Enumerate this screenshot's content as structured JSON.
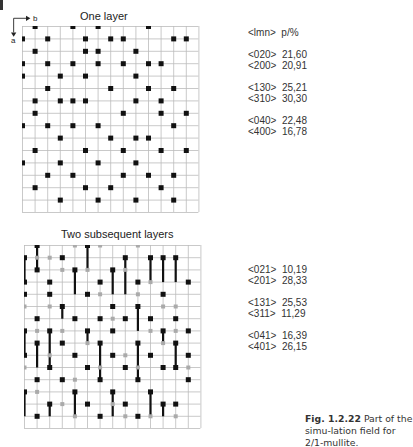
{
  "figure": {
    "axis_b_label": "b",
    "axis_a_label": "a",
    "panel1": {
      "title": "One layer",
      "cols": 14,
      "rows": 15,
      "dots": [
        [
          1,
          0
        ],
        [
          4,
          0
        ],
        [
          6,
          0
        ],
        [
          8,
          1
        ],
        [
          0,
          1
        ],
        [
          2,
          1
        ],
        [
          5,
          1
        ],
        [
          10,
          0
        ],
        [
          12,
          1
        ],
        [
          13,
          1
        ],
        [
          1,
          2
        ],
        [
          7,
          1
        ],
        [
          9,
          2
        ],
        [
          5,
          2
        ],
        [
          6,
          2
        ],
        [
          0,
          3
        ],
        [
          2,
          3
        ],
        [
          4,
          3
        ],
        [
          6,
          3
        ],
        [
          8,
          3
        ],
        [
          10,
          3
        ],
        [
          11,
          3
        ],
        [
          3,
          4
        ],
        [
          0,
          4
        ],
        [
          5,
          4
        ],
        [
          9,
          4
        ],
        [
          12,
          5
        ],
        [
          2,
          5
        ],
        [
          7,
          5
        ],
        [
          10,
          5
        ],
        [
          3,
          6
        ],
        [
          5,
          6
        ],
        [
          11,
          6
        ],
        [
          1,
          6
        ],
        [
          4,
          6
        ],
        [
          9,
          6
        ],
        [
          1,
          7
        ],
        [
          8,
          7
        ],
        [
          11,
          7
        ],
        [
          13,
          7
        ],
        [
          0,
          8
        ],
        [
          6,
          8
        ],
        [
          2,
          8
        ],
        [
          4,
          8
        ],
        [
          12,
          8
        ],
        [
          3,
          9
        ],
        [
          7,
          9
        ],
        [
          9,
          9
        ],
        [
          10,
          9
        ],
        [
          1,
          10
        ],
        [
          5,
          10
        ],
        [
          8,
          10
        ],
        [
          11,
          10
        ],
        [
          13,
          10
        ],
        [
          0,
          11
        ],
        [
          3,
          11
        ],
        [
          6,
          11
        ],
        [
          9,
          11
        ],
        [
          2,
          12
        ],
        [
          4,
          12
        ],
        [
          8,
          12
        ],
        [
          10,
          12
        ],
        [
          12,
          12
        ],
        [
          1,
          13
        ],
        [
          5,
          13
        ],
        [
          7,
          13
        ],
        [
          11,
          13
        ],
        [
          3,
          14
        ],
        [
          6,
          14
        ],
        [
          9,
          14
        ],
        [
          12,
          14
        ]
      ],
      "table": [
        {
          "hkl": "<lmn>",
          "p": "p/%"
        },
        null,
        {
          "hkl": "<020>",
          "p": "21,60"
        },
        {
          "hkl": "<200>",
          "p": "20,91"
        },
        null,
        {
          "hkl": "<130>",
          "p": "25,21"
        },
        {
          "hkl": "<310>",
          "p": "30,30"
        },
        null,
        {
          "hkl": "<040>",
          "p": "22,48"
        },
        {
          "hkl": "<400>",
          "p": "16,78"
        }
      ]
    },
    "panel2": {
      "title": "Two subsequent layers",
      "cols": 14,
      "rows": 15,
      "black": [
        [
          0,
          1
        ],
        [
          1,
          0
        ],
        [
          3,
          1
        ],
        [
          5,
          0
        ],
        [
          8,
          1
        ],
        [
          10,
          1
        ],
        [
          11,
          1
        ],
        [
          12,
          1
        ],
        [
          0,
          3
        ],
        [
          1,
          2
        ],
        [
          2,
          3
        ],
        [
          4,
          2
        ],
        [
          6,
          3
        ],
        [
          7,
          2
        ],
        [
          9,
          3
        ],
        [
          13,
          3
        ],
        [
          0,
          4
        ],
        [
          2,
          4
        ],
        [
          3,
          5
        ],
        [
          5,
          4
        ],
        [
          7,
          5
        ],
        [
          9,
          5
        ],
        [
          11,
          4
        ],
        [
          1,
          6
        ],
        [
          4,
          6
        ],
        [
          6,
          6
        ],
        [
          8,
          6
        ],
        [
          10,
          6
        ],
        [
          12,
          6
        ],
        [
          0,
          7
        ],
        [
          2,
          7
        ],
        [
          5,
          7
        ],
        [
          7,
          7
        ],
        [
          11,
          7
        ],
        [
          13,
          7
        ],
        [
          1,
          8
        ],
        [
          3,
          8
        ],
        [
          6,
          8
        ],
        [
          9,
          8
        ],
        [
          12,
          8
        ],
        [
          0,
          9
        ],
        [
          4,
          9
        ],
        [
          7,
          9
        ],
        [
          10,
          9
        ],
        [
          13,
          9
        ],
        [
          2,
          10
        ],
        [
          5,
          10
        ],
        [
          8,
          10
        ],
        [
          11,
          10
        ],
        [
          12,
          10
        ],
        [
          1,
          11
        ],
        [
          3,
          11
        ],
        [
          6,
          11
        ],
        [
          9,
          11
        ],
        [
          13,
          11
        ],
        [
          0,
          12
        ],
        [
          4,
          12
        ],
        [
          7,
          12
        ],
        [
          10,
          12
        ],
        [
          2,
          13
        ],
        [
          5,
          13
        ],
        [
          8,
          13
        ],
        [
          11,
          13
        ],
        [
          12,
          13
        ],
        [
          1,
          14
        ],
        [
          6,
          14
        ],
        [
          9,
          14
        ]
      ],
      "grey": [
        [
          1,
          1
        ],
        [
          2,
          1
        ],
        [
          4,
          0
        ],
        [
          6,
          0
        ],
        [
          9,
          0
        ],
        [
          3,
          2
        ],
        [
          5,
          2
        ],
        [
          8,
          2
        ],
        [
          10,
          3
        ],
        [
          0,
          5
        ],
        [
          2,
          5
        ],
        [
          6,
          4
        ],
        [
          9,
          4
        ],
        [
          11,
          5
        ],
        [
          12,
          5
        ],
        [
          1,
          7
        ],
        [
          3,
          7
        ],
        [
          7,
          6
        ],
        [
          10,
          7
        ],
        [
          12,
          7
        ],
        [
          2,
          9
        ],
        [
          5,
          8
        ],
        [
          8,
          9
        ],
        [
          11,
          8
        ],
        [
          0,
          10
        ],
        [
          4,
          11
        ],
        [
          6,
          10
        ],
        [
          9,
          10
        ],
        [
          13,
          10
        ],
        [
          1,
          12
        ],
        [
          3,
          13
        ],
        [
          7,
          13
        ],
        [
          10,
          14
        ],
        [
          12,
          14
        ],
        [
          4,
          14
        ],
        [
          8,
          14
        ]
      ],
      "bars": [
        [
          0,
          1,
          3
        ],
        [
          1,
          0,
          2
        ],
        [
          5,
          0,
          2
        ],
        [
          8,
          1,
          4
        ],
        [
          10,
          1,
          3
        ],
        [
          11,
          1,
          3
        ],
        [
          12,
          1,
          3
        ],
        [
          4,
          2,
          4
        ],
        [
          7,
          2,
          4
        ],
        [
          3,
          5,
          6
        ],
        [
          9,
          5,
          7
        ],
        [
          0,
          7,
          9
        ],
        [
          2,
          7,
          10
        ],
        [
          5,
          7,
          8
        ],
        [
          11,
          7,
          8
        ],
        [
          1,
          8,
          10
        ],
        [
          6,
          8,
          11
        ],
        [
          9,
          8,
          11
        ],
        [
          12,
          8,
          10
        ],
        [
          0,
          12,
          14
        ],
        [
          4,
          12,
          14
        ],
        [
          7,
          12,
          14
        ],
        [
          10,
          12,
          14
        ],
        [
          2,
          13,
          14
        ],
        [
          11,
          13,
          14
        ]
      ],
      "table": [
        {
          "hkl": "<021>",
          "p": "10,19"
        },
        {
          "hkl": "<201>",
          "p": "28,33"
        },
        null,
        {
          "hkl": "<131>",
          "p": "25,53"
        },
        {
          "hkl": "<311>",
          "p": "11,29"
        },
        null,
        {
          "hkl": "<041>",
          "p": "16,39"
        },
        {
          "hkl": "<401>",
          "p": "26,15"
        }
      ]
    },
    "caption": {
      "label": "Fig. 1.2.22",
      "text": "Part of the simu-lation field for 2/1-mullite."
    }
  }
}
